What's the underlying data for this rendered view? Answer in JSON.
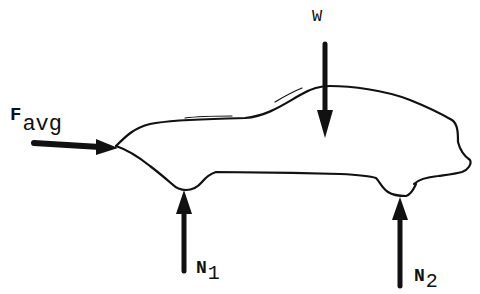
{
  "diagram": {
    "type": "free-body-diagram",
    "colors": {
      "ink": "#111111",
      "background": "#ffffff"
    },
    "forces": [
      {
        "id": "f_avg",
        "symbol": "F",
        "subscript": "avg",
        "direction": "right",
        "applied_at": "front bumper"
      },
      {
        "id": "w",
        "symbol": "W",
        "subscript": "",
        "direction": "down",
        "applied_at": "center of car"
      },
      {
        "id": "n1",
        "symbol": "N",
        "subscript": "1",
        "direction": "up",
        "applied_at": "front wheel"
      },
      {
        "id": "n2",
        "symbol": "N",
        "subscript": "2",
        "direction": "up",
        "applied_at": "rear wheel"
      }
    ]
  },
  "labels": {
    "f_avg": {
      "main": "F",
      "sub": "avg"
    },
    "w": {
      "main": "W"
    },
    "n1": {
      "main": "N",
      "sub": "1"
    },
    "n2": {
      "main": "N",
      "sub": "2"
    }
  }
}
